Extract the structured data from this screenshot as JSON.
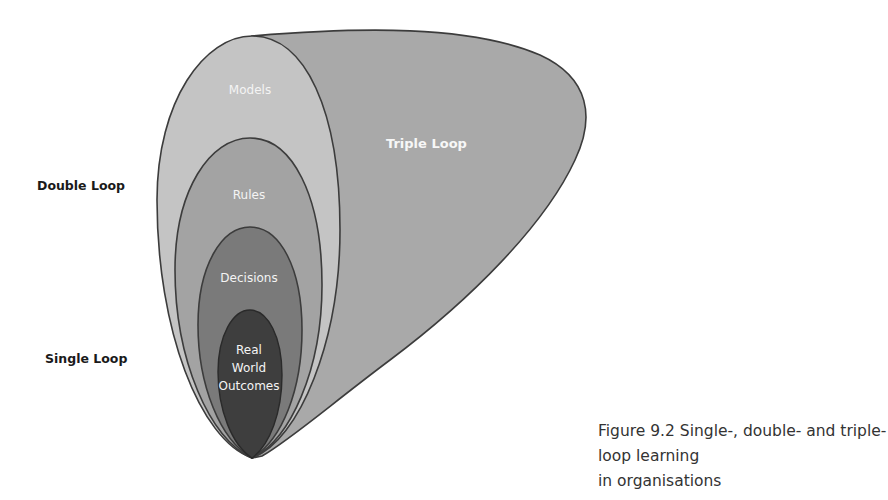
{
  "diagram": {
    "title": "Single-, double- and triple-loop learning in organisations",
    "side_labels": {
      "double_loop": "Double Loop",
      "single_loop": "Single Loop"
    },
    "shapes": {
      "triple_loop": {
        "label": "Triple Loop",
        "fill": "#a9a9a9",
        "stroke": "#3c3c3c"
      },
      "models": {
        "label": "Models",
        "fill": "#c4c4c4",
        "stroke": "#3c3c3c"
      },
      "rules": {
        "label": "Rules",
        "fill": "#a3a3a3",
        "stroke": "#3c3c3c"
      },
      "decisions": {
        "label": "Decisions",
        "fill": "#7a7a7a",
        "stroke": "#3c3c3c"
      },
      "outcomes": {
        "line1": "Real",
        "line2": "World",
        "line3": "Outcomes",
        "fill": "#3e3e3e",
        "stroke": "#2a2a2a"
      }
    }
  },
  "caption": {
    "line1": "Figure 9.2 Single-, double- and triple-loop learning",
    "line2": "in organisations"
  }
}
